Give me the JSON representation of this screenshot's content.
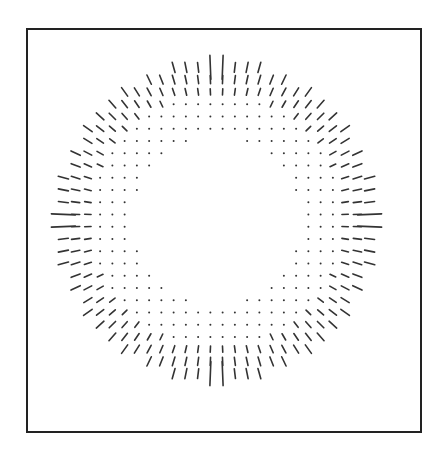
{
  "figure": {
    "frame": {
      "left": 26,
      "top": 28,
      "right": 420,
      "bottom": 431,
      "stroke": "#222222",
      "stroke_width": 2
    },
    "ink_color": "#333333",
    "field": {
      "description": "Radial orientation field on a square grid: blank center, a ring of dots, outer ring of radially oriented line segments",
      "center": {
        "x": 216.5,
        "y": 220.5
      },
      "spacing": 12.25,
      "index_min": -12.5,
      "index_max": 12.5,
      "blank_radius": 6.9,
      "dot_radius_max": 10.3,
      "outer_radius": 13.2,
      "stroke_len_min": 6,
      "stroke_len_max": 11,
      "axis_extension": {
        "length": 24,
        "note": "central axis rows/columns have longer bars at the rim"
      },
      "dot_size": 1.4,
      "stroke_width": 1.6
    }
  }
}
